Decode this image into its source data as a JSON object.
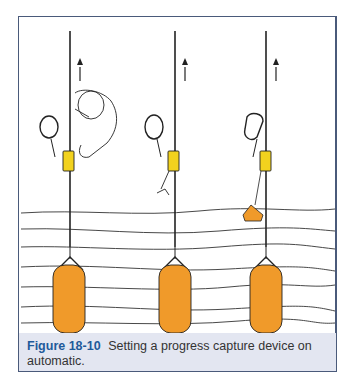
{
  "figure": {
    "label": "Figure 18-10",
    "caption": "Setting a progress capture device on automatic.",
    "colors": {
      "frame_border": "#4a5a7a",
      "caption_background": "#e3e6f1",
      "label_color": "#1e5a9a",
      "device_yellow": "#f2d21e",
      "bag_orange": "#f09a2a",
      "line": "#222222"
    },
    "panels": [
      {
        "name": "panel-1",
        "description": "hand setting capture device on rope, arrow up"
      },
      {
        "name": "panel-2",
        "description": "device set, trip line hanging, arrow up"
      },
      {
        "name": "panel-3",
        "description": "device set with handle hanging, arrow up"
      }
    ]
  }
}
